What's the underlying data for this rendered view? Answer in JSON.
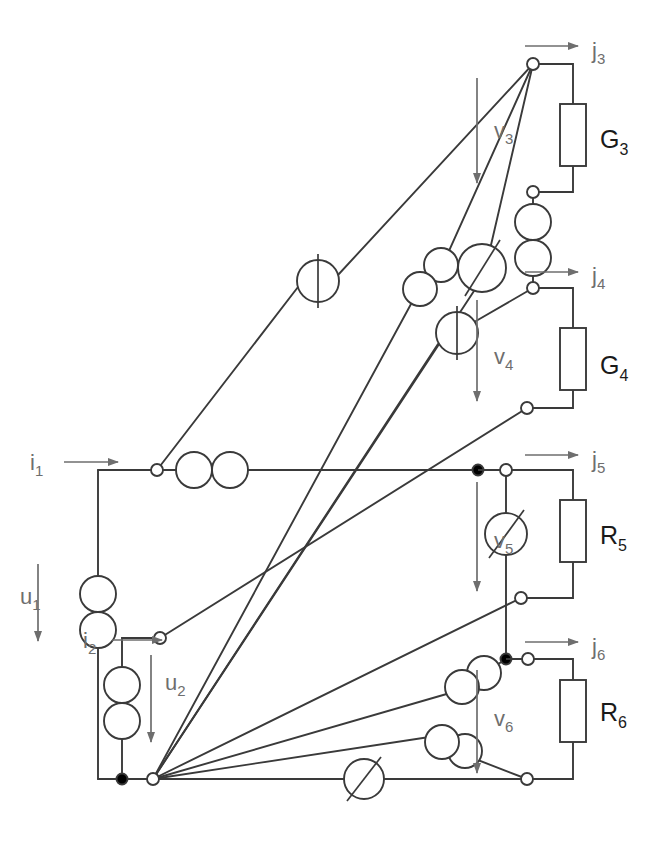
{
  "diagram": {
    "type": "electrical-schematic",
    "canvas": {
      "width": 655,
      "height": 846
    },
    "colors": {
      "wire": "#3a3a3a",
      "wire_light": "#555555",
      "label_gray": "#6e6e6e",
      "label_dark": "#1a1a1a",
      "node_fill": "#ffffff",
      "node_solid": "#000000",
      "background": "#ffffff"
    },
    "labels": {
      "i1": {
        "text": "i",
        "sub": "1",
        "x": 30,
        "y": 462
      },
      "u1": {
        "text": "u",
        "sub": "1",
        "x": 22,
        "y": 600
      },
      "i2": {
        "text": "i",
        "sub": "2",
        "x": 83,
        "y": 640
      },
      "u2": {
        "text": "u",
        "sub": "2",
        "x": 167,
        "y": 682
      },
      "j3": {
        "text": "j",
        "sub": "3",
        "x": 594,
        "y": 57
      },
      "v3": {
        "text": "v",
        "sub": "3",
        "x": 498,
        "y": 135
      },
      "G3": {
        "text": "G",
        "sub": "3",
        "x": 604,
        "y": 146
      },
      "j4": {
        "text": "j",
        "sub": "4",
        "x": 594,
        "y": 283
      },
      "v4": {
        "text": "v",
        "sub": "4",
        "x": 498,
        "y": 362
      },
      "G4": {
        "text": "G",
        "sub": "4",
        "x": 604,
        "y": 372
      },
      "j5": {
        "text": "j",
        "sub": "5",
        "x": 594,
        "y": 470
      },
      "v5": {
        "text": "v",
        "sub": "5",
        "x": 498,
        "y": 545
      },
      "R5": {
        "text": "R",
        "sub": "5",
        "x": 604,
        "y": 541
      },
      "j6": {
        "text": "j",
        "sub": "6",
        "x": 594,
        "y": 653
      },
      "v6": {
        "text": "v",
        "sub": "6",
        "x": 498,
        "y": 722
      },
      "R6": {
        "text": "R",
        "sub": "6",
        "x": 604,
        "y": 718
      }
    },
    "nodes": [
      {
        "name": "node-j3-top",
        "x": 533,
        "y": 64,
        "style": "open"
      },
      {
        "name": "node-g3-bottom",
        "x": 533,
        "y": 192,
        "style": "open"
      },
      {
        "name": "node-j4-top",
        "x": 533,
        "y": 288,
        "style": "open"
      },
      {
        "name": "node-g4-bottom",
        "x": 527,
        "y": 408,
        "style": "open"
      },
      {
        "name": "node-j5-top",
        "x": 533,
        "y": 470,
        "style": "open"
      },
      {
        "name": "node-j5-tee",
        "x": 506,
        "y": 470,
        "style": "solid"
      },
      {
        "name": "node-r5-bottom",
        "x": 521,
        "y": 598,
        "style": "open"
      },
      {
        "name": "node-j6-top",
        "x": 533,
        "y": 659,
        "style": "open"
      },
      {
        "name": "node-j6-tee",
        "x": 506,
        "y": 659,
        "style": "solid"
      },
      {
        "name": "node-r6-bottom",
        "x": 527,
        "y": 779,
        "style": "open"
      },
      {
        "name": "node-i1-left",
        "x": 157,
        "y": 470,
        "style": "open"
      },
      {
        "name": "node-i2-left",
        "x": 160,
        "y": 638,
        "style": "open"
      },
      {
        "name": "node-hub-bottom",
        "x": 153,
        "y": 779,
        "style": "open"
      },
      {
        "name": "node-u1-bottom",
        "x": 98,
        "y": 779,
        "style": "solid"
      },
      {
        "name": "node-u2-bottom",
        "x": 122,
        "y": 779,
        "style": "solid"
      }
    ],
    "resistors": [
      {
        "name": "resistor-G3",
        "label": "G3",
        "x": 560,
        "y": 104,
        "w": 26,
        "h": 62
      },
      {
        "name": "resistor-G4",
        "label": "G4",
        "x": 560,
        "y": 328,
        "w": 26,
        "h": 62
      },
      {
        "name": "resistor-R5",
        "label": "R5",
        "x": 560,
        "y": 500,
        "w": 26,
        "h": 62
      },
      {
        "name": "resistor-R6",
        "label": "R6",
        "x": 560,
        "y": 680,
        "w": 26,
        "h": 62
      }
    ],
    "sources": [
      {
        "name": "source-vccs-a",
        "kind": "bar-circle",
        "cx": 318,
        "cy": 281,
        "r": 21,
        "angle": 0
      },
      {
        "name": "source-vccs-b",
        "kind": "bar-circle",
        "cx": 457,
        "cy": 333,
        "r": 21,
        "angle": 0
      },
      {
        "name": "source-variable-a",
        "kind": "slash-circle",
        "cx": 482,
        "cy": 268,
        "r": 24,
        "angle": 0
      },
      {
        "name": "source-variable-v5",
        "kind": "slash-circle",
        "cx": 506,
        "cy": 534,
        "r": 21,
        "angle": 0
      },
      {
        "name": "source-variable-bottom",
        "kind": "slash-circle",
        "cx": 364,
        "cy": 779,
        "r": 20,
        "angle": 0
      },
      {
        "name": "source-pair-i1",
        "kind": "twin-circle-h",
        "cx": 212,
        "cy": 470,
        "r": 18
      },
      {
        "name": "source-pair-u1",
        "kind": "twin-circle-v",
        "cx": 98,
        "cy": 612,
        "r": 18
      },
      {
        "name": "source-pair-u2",
        "kind": "twin-circle-v",
        "cx": 122,
        "cy": 703,
        "r": 18
      },
      {
        "name": "source-pair-g34",
        "kind": "twin-circle-v",
        "cx": 533,
        "cy": 240,
        "r": 18
      },
      {
        "name": "source-pair-mid",
        "kind": "twin-circle-diag",
        "cx": 430,
        "cy": 277,
        "r": 17
      },
      {
        "name": "source-pair-lower",
        "kind": "twin-circle-diag",
        "cx": 473,
        "cy": 680,
        "r": 17
      },
      {
        "name": "source-pair-lowest",
        "kind": "twin-circle-diag",
        "cx": 453,
        "cy": 745,
        "r": 17
      }
    ],
    "arrows": [
      {
        "name": "arrow-i1",
        "x1": 64,
        "y1": 462,
        "x2": 120,
        "y2": 462
      },
      {
        "name": "arrow-i2",
        "x1": 112,
        "y1": 640,
        "x2": 160,
        "y2": 640
      },
      {
        "name": "arrow-u1",
        "x1": 38,
        "y1": 564,
        "x2": 38,
        "y2": 640,
        "dir": "down"
      },
      {
        "name": "arrow-u2",
        "x1": 151,
        "y1": 655,
        "x2": 151,
        "y2": 740,
        "dir": "down"
      },
      {
        "name": "arrow-j3",
        "x1": 525,
        "y1": 46,
        "x2": 578,
        "y2": 46
      },
      {
        "name": "arrow-v3",
        "x1": 477,
        "y1": 78,
        "x2": 477,
        "y2": 182,
        "dir": "down"
      },
      {
        "name": "arrow-j4",
        "x1": 525,
        "y1": 272,
        "x2": 578,
        "y2": 272
      },
      {
        "name": "arrow-v4",
        "x1": 477,
        "y1": 300,
        "x2": 477,
        "y2": 400,
        "dir": "down"
      },
      {
        "name": "arrow-j5",
        "x1": 525,
        "y1": 455,
        "x2": 578,
        "y2": 455
      },
      {
        "name": "arrow-v5",
        "x1": 477,
        "y1": 482,
        "x2": 477,
        "y2": 590,
        "dir": "down"
      },
      {
        "name": "arrow-j6",
        "x1": 525,
        "y1": 642,
        "x2": 578,
        "y2": 642
      },
      {
        "name": "arrow-v6",
        "x1": 477,
        "y1": 670,
        "x2": 477,
        "y2": 772,
        "dir": "down"
      }
    ],
    "wires": {
      "loop_left": "M157,470 L98,470 L98,594",
      "u1_lower": "M98,630 L98,779",
      "bottom_rail": "M98,779 L527,779",
      "i1_branch": "M157,470 L194,470 M230,470 L506,470",
      "i2_branch": "M160,638 L122,638 L122,685",
      "u2_lower": "M122,721 L122,779",
      "g3_top": "M533,64 L573,64 L573,104",
      "g3_bottom": "M573,166 L573,192 L533,192",
      "g3_stem": "M533,192 L533,222",
      "g34_link": "M533,258 L533,288",
      "g4_top": "M533,288 L573,288 L573,328",
      "g4_bottom": "M573,390 L573,408 L527,408",
      "j5_top": "M506,470 L573,470 L573,500",
      "r5_bottom": "M573,562 L573,598 L521,598",
      "v5_stem": "M506,470 L506,513 M506,555 L506,659",
      "j6_top": "M506,659 L573,659 L573,680",
      "r6_bottom": "M573,742 L573,779 L527,779"
    },
    "diagonals": [
      {
        "name": "diag-top-to-single",
        "x1": 533,
        "y1": 64,
        "x2": 157,
        "y2": 470,
        "via": "source-vccs-single"
      },
      {
        "name": "diag-top-to-hub-a",
        "x1": 533,
        "y1": 64,
        "x2": 153,
        "y2": 779,
        "via": "source-pair-mid"
      },
      {
        "name": "diag-top-to-hub-b",
        "x1": 533,
        "y1": 64,
        "x2": 153,
        "y2": 779,
        "via": "source-variable-a"
      },
      {
        "name": "diag-j4-to-hub",
        "x1": 533,
        "y1": 288,
        "x2": 153,
        "y2": 779,
        "via": "source-vccs-b"
      },
      {
        "name": "diag-g4bot-to-i2",
        "x1": 527,
        "y1": 408,
        "x2": 160,
        "y2": 638
      },
      {
        "name": "diag-r5bot-to-hub",
        "x1": 521,
        "y1": 598,
        "x2": 153,
        "y2": 779
      },
      {
        "name": "diag-j6-to-hub",
        "x1": 506,
        "y1": 659,
        "x2": 153,
        "y2": 779,
        "via": "source-pair-lower"
      },
      {
        "name": "diag-r6bot-to-hub",
        "x1": 527,
        "y1": 779,
        "x2": 153,
        "y2": 779,
        "via": "source-pair-lowest"
      }
    ]
  }
}
